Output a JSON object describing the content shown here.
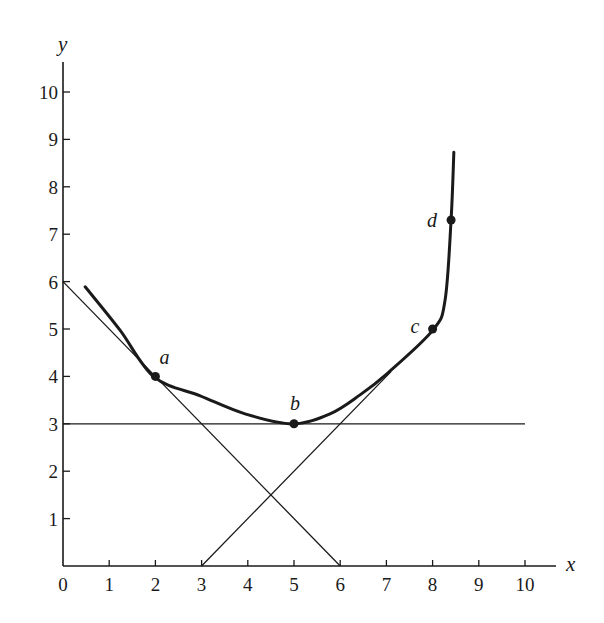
{
  "chart_data": {
    "type": "line",
    "title": "",
    "xlabel": "x",
    "ylabel": "y",
    "xlim": [
      0,
      10.6
    ],
    "ylim": [
      0,
      10.6
    ],
    "grid": false,
    "legend": null,
    "x_ticks": [
      0,
      1,
      2,
      3,
      4,
      5,
      6,
      7,
      8,
      9,
      10
    ],
    "y_ticks": [
      1,
      2,
      3,
      4,
      5,
      6,
      7,
      8,
      9,
      10
    ],
    "series": [
      {
        "name": "curve",
        "style": "thick",
        "points": [
          [
            0.48,
            5.89
          ],
          [
            1.23,
            4.98
          ],
          [
            1.97,
            3.99
          ],
          [
            2.97,
            3.59
          ],
          [
            3.94,
            3.21
          ],
          [
            4.96,
            3.0
          ],
          [
            5.78,
            3.21
          ],
          [
            6.43,
            3.61
          ],
          [
            7.03,
            4.07
          ],
          [
            8.01,
            4.98
          ],
          [
            8.27,
            5.61
          ],
          [
            8.4,
            7.3
          ],
          [
            8.46,
            8.73
          ]
        ]
      },
      {
        "name": "tangent-at-a",
        "style": "thin",
        "equation": "y = 6 - x",
        "points": [
          [
            0,
            6
          ],
          [
            6,
            0
          ]
        ]
      },
      {
        "name": "tangent-at-b",
        "style": "thin",
        "equation": "y = 3",
        "points": [
          [
            0,
            3
          ],
          [
            10,
            3
          ]
        ]
      },
      {
        "name": "tangent-near-c",
        "style": "thin",
        "equation": "y = x - 3",
        "points": [
          [
            3,
            0
          ],
          [
            7.1,
            4.1
          ]
        ]
      }
    ],
    "annotations": [
      {
        "label": "a",
        "x": 2,
        "y": 4
      },
      {
        "label": "b",
        "x": 5,
        "y": 3
      },
      {
        "label": "c",
        "x": 8,
        "y": 5
      },
      {
        "label": "d",
        "x": 8.4,
        "y": 7.3
      }
    ]
  },
  "labels": {
    "x_axis": "x",
    "y_axis": "y",
    "origin": "0"
  },
  "colors": {
    "ink": "#1a1a1a",
    "background": "#ffffff"
  }
}
